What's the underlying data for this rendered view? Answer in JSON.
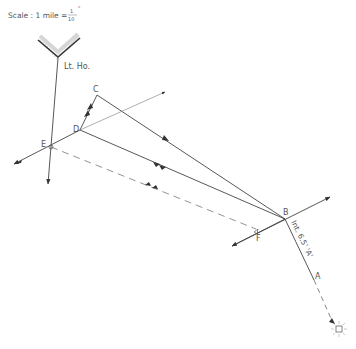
{
  "scale": {
    "label": "Scale : 1 mile =",
    "numerator": "1",
    "denominator": "10",
    "unit": "\""
  },
  "landmark": {
    "label": "Lt. Ho.",
    "icon": "lighthouse-headland-icon"
  },
  "points": {
    "A": "A",
    "B": "B",
    "C": "C",
    "D": "D",
    "E": "E",
    "F": "F"
  },
  "annotation": {
    "interval": "Int. 6.5' 'A'"
  },
  "sun_icon": "sun-icon",
  "colors": {
    "line": "#444444",
    "dashed": "#777777",
    "hatch": "#999999",
    "text": "#555555"
  }
}
